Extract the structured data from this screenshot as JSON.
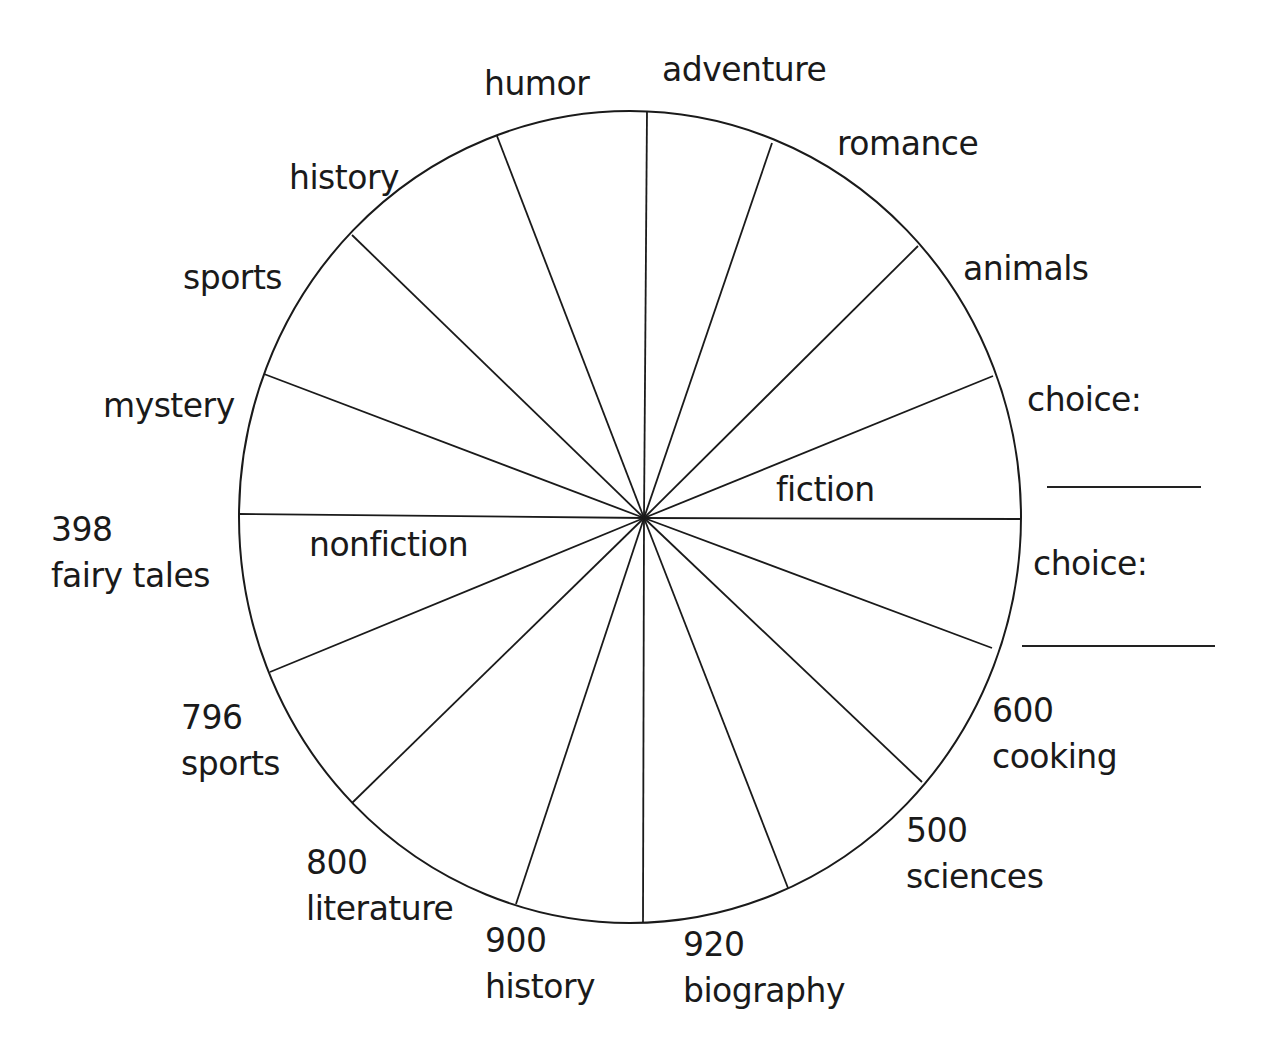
{
  "diagram": {
    "type": "genre-wheel",
    "hub": {
      "x": 644,
      "y": 518
    },
    "circle": {
      "cx": 630,
      "cy": 517,
      "rx": 391,
      "ry": 406,
      "stroke": "#1a1a1a"
    },
    "spokes": [
      {
        "x": 647,
        "y": 111
      },
      {
        "x": 772,
        "y": 143
      },
      {
        "x": 918,
        "y": 246
      },
      {
        "x": 993,
        "y": 376
      },
      {
        "x": 1020,
        "y": 519
      },
      {
        "x": 992,
        "y": 648
      },
      {
        "x": 922,
        "y": 782
      },
      {
        "x": 788,
        "y": 888
      },
      {
        "x": 643,
        "y": 923
      },
      {
        "x": 516,
        "y": 904
      },
      {
        "x": 352,
        "y": 803
      },
      {
        "x": 270,
        "y": 672
      },
      {
        "x": 239,
        "y": 514
      },
      {
        "x": 264,
        "y": 374
      },
      {
        "x": 352,
        "y": 235
      },
      {
        "x": 497,
        "y": 136
      }
    ],
    "inner_labels": {
      "fiction": "fiction",
      "nonfiction": "nonfiction"
    },
    "fiction_labels": {
      "humor": "humor",
      "adventure": "adventure",
      "romance": "romance",
      "animals": "animals",
      "choice_1": "choice:",
      "choice_2": "choice:",
      "history": "history",
      "sports": "sports",
      "mystery": "mystery"
    },
    "nonfiction_labels": [
      {
        "number": "398",
        "name": "fairy tales"
      },
      {
        "number": "796",
        "name": "sports"
      },
      {
        "number": "800",
        "name": "literature"
      },
      {
        "number": "900",
        "name": "history"
      },
      {
        "number": "920",
        "name": "biography"
      },
      {
        "number": "500",
        "name": "sciences"
      },
      {
        "number": "600",
        "name": "cooking"
      }
    ]
  }
}
